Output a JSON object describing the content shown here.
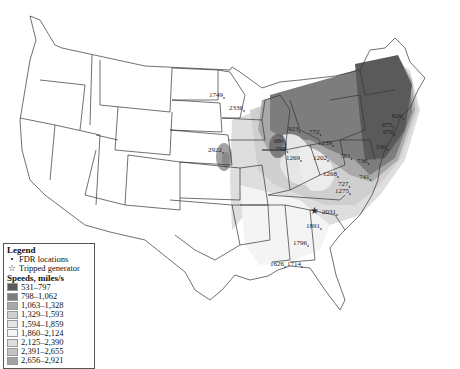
{
  "map": {
    "title": "",
    "region": "Contiguous United States",
    "labels": [
      {
        "text": "1749",
        "x": 209,
        "y": 97
      },
      {
        "text": "2336",
        "x": 229,
        "y": 110
      },
      {
        "text": "2922",
        "x": 208,
        "y": 152
      },
      {
        "text": "923",
        "x": 288,
        "y": 131
      },
      {
        "text": "772",
        "x": 309,
        "y": 134
      },
      {
        "text": "1239",
        "x": 318,
        "y": 145
      },
      {
        "text": "686",
        "x": 274,
        "y": 143
      },
      {
        "text": "798",
        "x": 276,
        "y": 151
      },
      {
        "text": "1269",
        "x": 286,
        "y": 160
      },
      {
        "text": "1202",
        "x": 313,
        "y": 160
      },
      {
        "text": "781",
        "x": 340,
        "y": 158
      },
      {
        "text": "1268",
        "x": 323,
        "y": 176
      },
      {
        "text": "727",
        "x": 338,
        "y": 186
      },
      {
        "text": "1275",
        "x": 335,
        "y": 193
      },
      {
        "text": "741",
        "x": 359,
        "y": 179
      },
      {
        "text": "736",
        "x": 357,
        "y": 163
      },
      {
        "text": "626",
        "x": 392,
        "y": 118
      },
      {
        "text": "675",
        "x": 382,
        "y": 127
      },
      {
        "text": "670",
        "x": 383,
        "y": 134
      },
      {
        "text": "530",
        "x": 376,
        "y": 149
      },
      {
        "text": "2031",
        "x": 322,
        "y": 214
      },
      {
        "text": "1891",
        "x": 306,
        "y": 228
      },
      {
        "text": "1796",
        "x": 293,
        "y": 245
      },
      {
        "text": "1626",
        "x": 270,
        "y": 266
      },
      {
        "text": "1714",
        "x": 287,
        "y": 266
      }
    ],
    "tripped_generator": {
      "x": 314,
      "y": 211
    }
  },
  "legend": {
    "title": "Legend",
    "fdr_label": "FDR locations",
    "generator_label": "Tripped generator",
    "speed_title": "Speeds, miles/s",
    "bins": [
      {
        "range": "531–797",
        "color": "#5a5a5a"
      },
      {
        "range": "798–1,062",
        "color": "#7d7d7d"
      },
      {
        "range": "1,063–1,328",
        "color": "#a9a9a9"
      },
      {
        "range": "1,329–1,593",
        "color": "#cfcfcf"
      },
      {
        "range": "1,594–1,859",
        "color": "#e6e6e6"
      },
      {
        "range": "1,860–2,124",
        "color": "#f4f4f4"
      },
      {
        "range": "2,125–2,390",
        "color": "#dedede"
      },
      {
        "range": "2,391–2,655",
        "color": "#c4c4c4"
      },
      {
        "range": "2,656–2,921",
        "color": "#a2a2a2"
      }
    ]
  }
}
